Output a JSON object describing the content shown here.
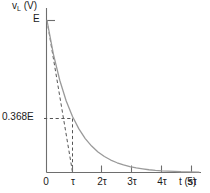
{
  "chart_data": {
    "type": "line",
    "title": "",
    "subtitle": "",
    "ylabel": "v",
    "ylabel_sub": "L",
    "ylabel_unit": " (V)",
    "xlabel": "t (s)",
    "grid": false,
    "legend": null,
    "xlim": [
      0,
      6
    ],
    "ylim": [
      0,
      1.0
    ],
    "x_tick_labels": [
      "0",
      "τ",
      "2τ",
      "3τ",
      "4τ",
      "5τ"
    ],
    "x_tick_values": [
      0,
      1,
      2,
      3,
      4,
      5
    ],
    "y_tick_labels": [
      "E",
      "0.368E"
    ],
    "y_tick_values": [
      1.0,
      0.368
    ],
    "series": [
      {
        "name": "v_L exponential decay",
        "equation": "E*exp(-t/tau)",
        "color": "#9a9a9a",
        "style": "solid",
        "x": [
          0,
          0.25,
          0.5,
          0.75,
          1,
          1.25,
          1.5,
          1.75,
          2,
          2.25,
          2.5,
          2.75,
          3,
          3.25,
          3.5,
          3.75,
          4,
          4.25,
          4.5,
          4.75,
          5,
          5.25,
          5.5
        ],
        "y": [
          1.0,
          0.779,
          0.607,
          0.472,
          0.368,
          0.287,
          0.223,
          0.174,
          0.135,
          0.105,
          0.082,
          0.064,
          0.05,
          0.039,
          0.03,
          0.024,
          0.018,
          0.014,
          0.011,
          0.009,
          0.007,
          0.005,
          0.004
        ]
      },
      {
        "name": "initial tangent",
        "color": "#555555",
        "style": "dashed",
        "x": [
          0,
          1
        ],
        "y": [
          1.0,
          0.0
        ]
      }
    ],
    "annotations": [
      {
        "name": "tau-horizontal-guide",
        "type": "dashed-h",
        "y": 0.368,
        "x_from": 0,
        "x_to": 1
      },
      {
        "name": "tau-vertical-guide",
        "type": "dashed-v",
        "x": 1,
        "y_from": 0,
        "y_to": 0.368
      }
    ],
    "axis_color": "#6e6e6e",
    "curve_color": "#9a9a9a",
    "dash_color": "#555555",
    "background": "#ffffff"
  },
  "labels": {
    "y_axis_title_main": "v",
    "y_axis_title_sub": "L",
    "y_axis_title_unit": " (V)",
    "y_tick_E": "E",
    "y_tick_368E": "0.368E",
    "x_tick_0": "0",
    "x_tick_1": "τ",
    "x_tick_2": "2τ",
    "x_tick_3": "3τ",
    "x_tick_4": "4τ",
    "x_tick_5": "5τ",
    "x_axis_title": "t (s)"
  }
}
